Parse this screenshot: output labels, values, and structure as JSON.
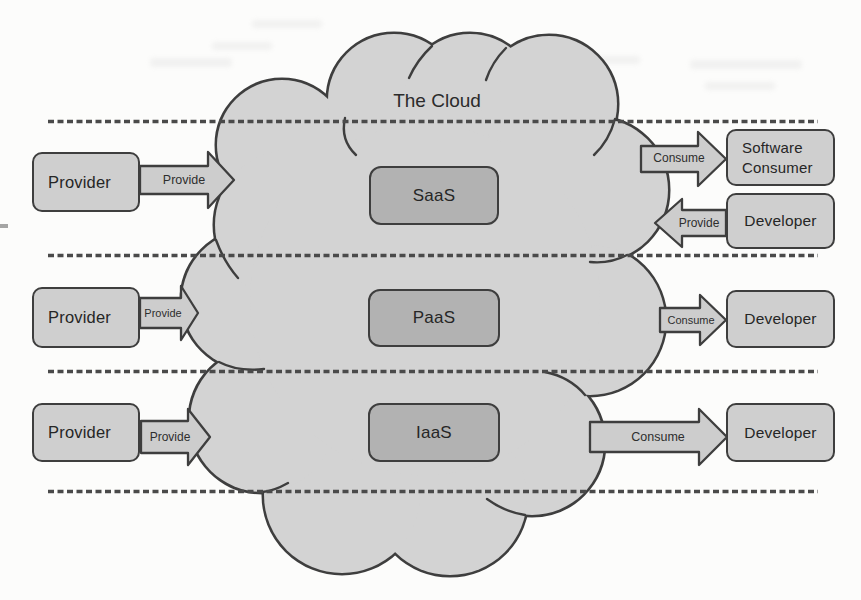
{
  "cloud": {
    "title": "The Cloud",
    "services": [
      "SaaS",
      "PaaS",
      "IaaS"
    ]
  },
  "providers": [
    {
      "label": "Provider",
      "arrow": "Provide"
    },
    {
      "label": "Provider",
      "arrow": "Provide"
    },
    {
      "label": "Provider",
      "arrow": "Provide"
    }
  ],
  "consumers": [
    {
      "label": "Software Consumer",
      "arrow": "Consume"
    },
    {
      "label": "Developer",
      "arrow": "Provide"
    },
    {
      "label": "Developer",
      "arrow": "Consume"
    },
    {
      "label": "Developer",
      "arrow": "Consume"
    }
  ],
  "colors": {
    "background": "#fcfcfb",
    "cloud_fill": "#d3d3d3",
    "box_fill": "#cfcfcf",
    "service_box_fill": "#b2b2b2",
    "arrow_fill": "#cdcdcd",
    "outline": "#3e3e3e",
    "dashed_line": "#4a4a4a",
    "text": "#2a2a2a"
  }
}
